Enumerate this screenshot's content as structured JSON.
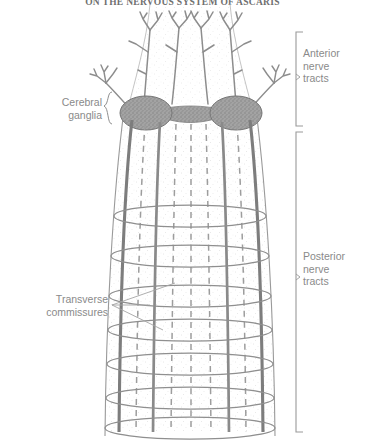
{
  "page": {
    "running_head": "ON THE NERVOUS SYSTEM OF ASCARIS",
    "background_color": "#ffffff",
    "ink_color": "#8a8a8a",
    "dark_ink_color": "#6f6f6f"
  },
  "figure": {
    "labels": {
      "anterior": {
        "line1": "Anterior",
        "line2": "nerve",
        "line3": "tracts"
      },
      "posterior": {
        "line1": "Posterior",
        "line2": "nerve",
        "line3": "tracts"
      },
      "cerebral": {
        "line1": "Cerebral",
        "line2": "ganglia"
      },
      "transverse": {
        "line1": "Transverse",
        "line2": "commissures"
      }
    },
    "brackets": [
      {
        "name": "anterior-bracket",
        "top": 32,
        "bottom": 126
      },
      {
        "name": "posterior-bracket",
        "top": 132,
        "bottom": 432
      }
    ],
    "structures": {
      "cerebral_ganglia_count": 2,
      "anterior_trunk_count": 4,
      "lateral_nerve_count": 2,
      "longitudinal_solid_cords": 4,
      "longitudinal_dashed_cords": 5,
      "transverse_commissure_rings": 7
    },
    "colors": {
      "body_outline": "#9a9a9a",
      "cord_solid": "#7d7d7d",
      "cord_dashed": "#9d9d9d",
      "ganglion_fill": "#9b9b9b",
      "ganglion_stroke": "#787878",
      "commissure": "#8f8f8f",
      "leader_line": "#a0a0a0"
    }
  }
}
